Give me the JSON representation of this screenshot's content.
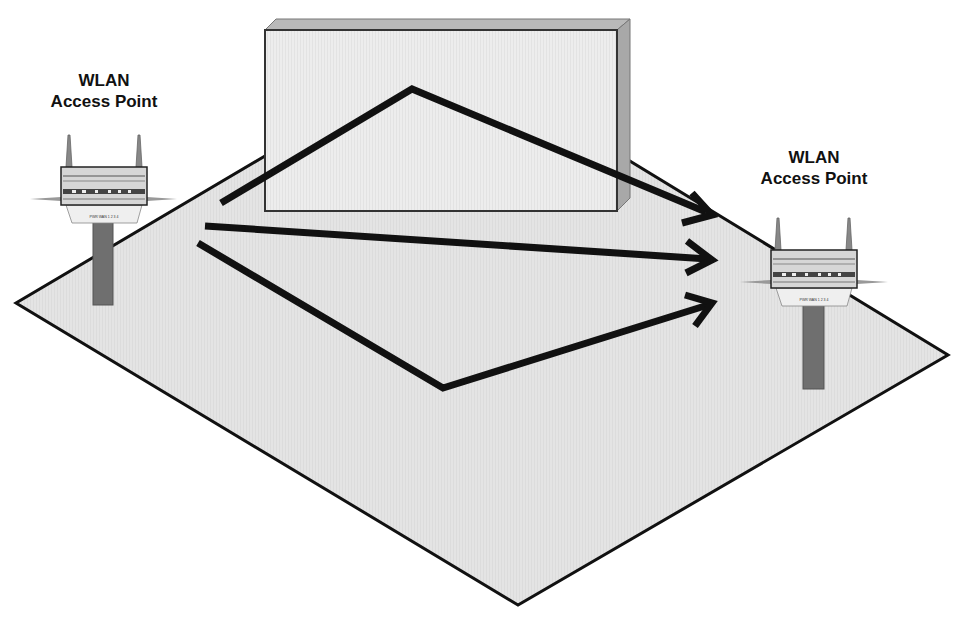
{
  "diagram": {
    "access_points": [
      {
        "id": "left",
        "label_line1": "WLAN",
        "label_line2": "Access Point",
        "port_labels": "PWR WAN 1 2 3 4"
      },
      {
        "id": "right",
        "label_line1": "WLAN",
        "label_line2": "Access Point",
        "port_labels": "PWR WAN 1 2 3 4"
      }
    ],
    "obstacle": "wall",
    "signal_paths": [
      {
        "name": "reflected-over-wall",
        "points": [
          [
            221,
            203
          ],
          [
            412,
            89
          ],
          [
            712,
            215
          ]
        ]
      },
      {
        "name": "direct-path",
        "points": [
          [
            205,
            226
          ],
          [
            712,
            260
          ]
        ]
      },
      {
        "name": "reflected-floor",
        "points": [
          [
            198,
            243
          ],
          [
            443,
            388
          ],
          [
            712,
            303
          ]
        ]
      }
    ],
    "colors": {
      "floor": "#e6e6e6",
      "wall_front": "#ececec",
      "wall_top": "#b8b8b8",
      "wall_side": "#a9a9a9",
      "pole": "#6f6f6f",
      "arrow": "#111111"
    }
  }
}
